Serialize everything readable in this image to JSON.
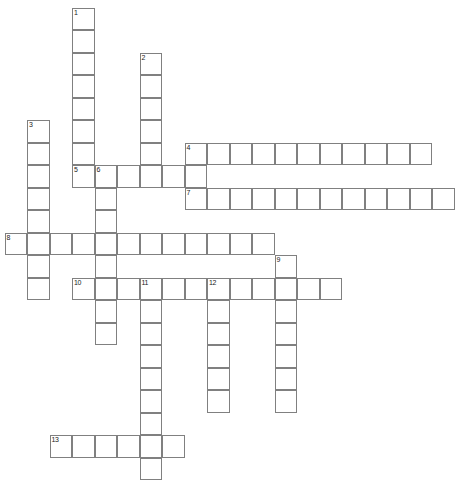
{
  "puzzle": {
    "kind": "crossword-grid",
    "title": "",
    "background_color": "#ffffff",
    "cell_border_color": "#808080",
    "number_color": "#222222",
    "cell_size": 22.5,
    "origin": {
      "x": 4.5,
      "y": 7.5
    },
    "grid_columns": 20,
    "grid_rows": 21,
    "entries": [
      {
        "number": "1",
        "direction": "down",
        "start": {
          "col": 3,
          "row": 0
        },
        "length": 8
      },
      {
        "number": "2",
        "direction": "down",
        "start": {
          "col": 6,
          "row": 2
        },
        "length": 6
      },
      {
        "number": "3",
        "direction": "down",
        "start": {
          "col": 1,
          "row": 5
        },
        "length": 8
      },
      {
        "number": "4",
        "direction": "across",
        "start": {
          "col": 8,
          "row": 6
        },
        "length": 11
      },
      {
        "number": "5",
        "direction": "across",
        "start": {
          "col": 3,
          "row": 7
        },
        "length": 6
      },
      {
        "number": "6",
        "direction": "down",
        "start": {
          "col": 4,
          "row": 7
        },
        "length": 8
      },
      {
        "number": "7",
        "direction": "across",
        "start": {
          "col": 8,
          "row": 8
        },
        "length": 12
      },
      {
        "number": "8",
        "direction": "across",
        "start": {
          "col": 0,
          "row": 10
        },
        "length": 12
      },
      {
        "number": "9",
        "direction": "down",
        "start": {
          "col": 12,
          "row": 11
        },
        "length": 7
      },
      {
        "number": "10",
        "direction": "across",
        "start": {
          "col": 3,
          "row": 12
        },
        "length": 12
      },
      {
        "number": "11",
        "direction": "down",
        "start": {
          "col": 6,
          "row": 12
        },
        "length": 9
      },
      {
        "number": "12",
        "direction": "down",
        "start": {
          "col": 9,
          "row": 12
        },
        "length": 6
      },
      {
        "number": "13",
        "direction": "across",
        "start": {
          "col": 2,
          "row": 19
        },
        "length": 6
      }
    ]
  }
}
